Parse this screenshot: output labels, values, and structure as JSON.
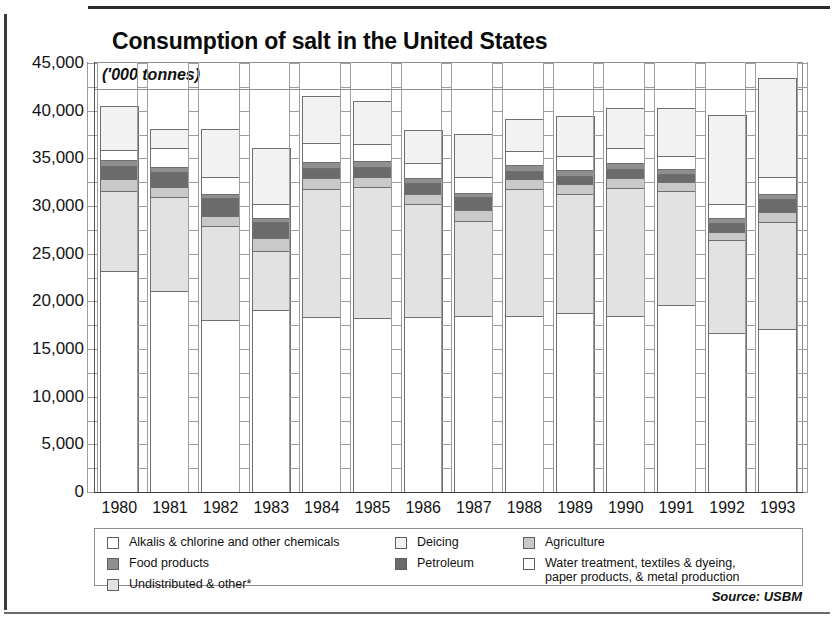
{
  "title": "Consumption of salt in the United States",
  "subtitle": "('000 tonnes)",
  "source": "Source: USBM",
  "axis": {
    "y_ticks": [
      "45,000",
      "40,000",
      "35,000",
      "30,000",
      "25,000",
      "20,000",
      "15,000",
      "10,000",
      "5,000",
      "0"
    ],
    "ylabel": "('000 tonnes)",
    "ymin": 0,
    "ymax": 45000,
    "step": 5000
  },
  "legend": {
    "col1": [
      {
        "label": "Alkalis & chlorine and other chemicals",
        "color": "#ffffff",
        "key": "alkalis"
      },
      {
        "label": "Food products",
        "color": "#8f8f8f",
        "key": "food"
      },
      {
        "label": "Undistributed & other*",
        "color": "#e2e2e2",
        "key": "undistributed"
      }
    ],
    "col2": [
      {
        "label": "Deicing",
        "color": "#f2f2f2",
        "key": "deicing"
      },
      {
        "label": "Petroleum",
        "color": "#6b6b6b",
        "key": "petroleum"
      }
    ],
    "col3": [
      {
        "label": "Agriculture",
        "color": "#c9c9c9",
        "key": "agriculture"
      },
      {
        "label": "Water treatment, textiles & dyeing,\npaper products, & metal production",
        "color": "#ffffff",
        "key": "water"
      }
    ]
  },
  "chart_data": {
    "type": "bar",
    "stacked": true,
    "title": "Consumption of salt in the United States",
    "subtitle": "('000 tonnes)",
    "xlabel": "",
    "ylabel": "('000 tonnes)",
    "ylim": [
      0,
      45000
    ],
    "ytick_step": 5000,
    "grid": true,
    "legend_position": "bottom",
    "source": "Source: USBM",
    "categories": [
      "1980",
      "1981",
      "1982",
      "1983",
      "1984",
      "1985",
      "1986",
      "1987",
      "1988",
      "1989",
      "1990",
      "1991",
      "1992",
      "1993"
    ],
    "series": [
      {
        "name": "Alkalis & chlorine and other chemicals",
        "color": "#ffffff",
        "values": [
          23300,
          21200,
          18100,
          19200,
          18500,
          18400,
          18500,
          18600,
          18600,
          18900,
          18600,
          19700,
          16800,
          17200
        ]
      },
      {
        "name": "Undistributed & other*",
        "color": "#e2e2e2",
        "values": [
          8400,
          9800,
          9900,
          6200,
          13400,
          13700,
          11800,
          9900,
          13300,
          12500,
          13400,
          12000,
          9700,
          11200
        ]
      },
      {
        "name": "Agriculture",
        "color": "#c9c9c9",
        "values": [
          1200,
          1100,
          1100,
          1300,
          1100,
          1100,
          1100,
          1200,
          1000,
          1000,
          1000,
          900,
          900,
          1100
        ]
      },
      {
        "name": "Petroleum",
        "color": "#6b6b6b",
        "values": [
          1400,
          1600,
          1800,
          1700,
          1100,
          1000,
          1100,
          1300,
          900,
          900,
          1000,
          900,
          900,
          1300
        ]
      },
      {
        "name": "Food products",
        "color": "#8f8f8f",
        "values": [
          600,
          500,
          500,
          500,
          600,
          600,
          500,
          500,
          600,
          600,
          600,
          500,
          500,
          600
        ]
      },
      {
        "name": "Water treatment, textiles & dyeing, paper products, & metal production",
        "color": "#ffffff",
        "values": [
          1100,
          2000,
          1700,
          1400,
          2000,
          1800,
          1600,
          1700,
          1500,
          1500,
          1600,
          1300,
          1500,
          1700
        ]
      },
      {
        "name": "Deicing",
        "color": "#f2f2f2",
        "values": [
          4600,
          2000,
          5100,
          5900,
          4900,
          4500,
          3500,
          4500,
          3300,
          4100,
          4200,
          5100,
          9300,
          10400
        ]
      }
    ],
    "totals": [
      40600,
      38200,
      38200,
      36200,
      41600,
      41100,
      38100,
      37700,
      39200,
      39500,
      40400,
      40400,
      39600,
      43500
    ]
  }
}
